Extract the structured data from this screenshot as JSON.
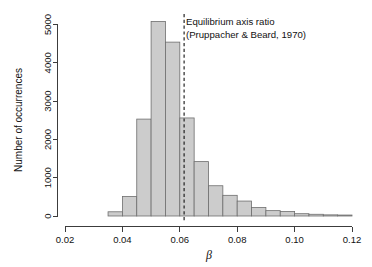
{
  "chart_data": {
    "type": "bar",
    "title": "",
    "subtitle": "",
    "xlabel": "β",
    "ylabel": "Number of occurrences",
    "xlim": [
      0.02,
      0.12
    ],
    "ylim": [
      0,
      5300
    ],
    "grid": false,
    "legend": null,
    "bin_width": 0.005,
    "x_ticks": [
      0.02,
      0.04,
      0.06,
      0.08,
      0.1,
      0.12
    ],
    "x_tick_labels": [
      "0.02",
      "0.04",
      "0.06",
      "0.08",
      "0.10",
      "0.12"
    ],
    "y_ticks": [
      0,
      1000,
      2000,
      3000,
      4000,
      5000
    ],
    "y_tick_labels": [
      "0",
      "1000",
      "2000",
      "3000",
      "4000",
      "5000"
    ],
    "bins": [
      {
        "left": 0.035,
        "right": 0.04,
        "value": 110
      },
      {
        "left": 0.04,
        "right": 0.045,
        "value": 510
      },
      {
        "left": 0.045,
        "right": 0.05,
        "value": 2530
      },
      {
        "left": 0.05,
        "right": 0.055,
        "value": 5080
      },
      {
        "left": 0.055,
        "right": 0.06,
        "value": 4540
      },
      {
        "left": 0.06,
        "right": 0.065,
        "value": 2560
      },
      {
        "left": 0.065,
        "right": 0.07,
        "value": 1420
      },
      {
        "left": 0.07,
        "right": 0.075,
        "value": 790
      },
      {
        "left": 0.075,
        "right": 0.08,
        "value": 540
      },
      {
        "left": 0.08,
        "right": 0.085,
        "value": 390
      },
      {
        "left": 0.085,
        "right": 0.09,
        "value": 220
      },
      {
        "left": 0.09,
        "right": 0.095,
        "value": 140
      },
      {
        "left": 0.095,
        "right": 0.1,
        "value": 120
      },
      {
        "left": 0.1,
        "right": 0.105,
        "value": 60
      },
      {
        "left": 0.105,
        "right": 0.11,
        "value": 45
      },
      {
        "left": 0.11,
        "right": 0.115,
        "value": 30
      },
      {
        "left": 0.115,
        "right": 0.12,
        "value": 25
      }
    ],
    "annotations": [
      {
        "name": "equilibrium-axis-ratio",
        "line1": "Equilibrium axis ratio",
        "line2": "(Pruppacher & Beard, 1970)",
        "vline_x": 0.0615,
        "vline_style": "dashed"
      }
    ],
    "colors": {
      "bar_fill": "#cccccc",
      "bar_stroke": "#6e6e6e",
      "axis": "#3c3c3c",
      "text": "#111111",
      "reference_line": "#111111",
      "background": "#ffffff"
    }
  }
}
